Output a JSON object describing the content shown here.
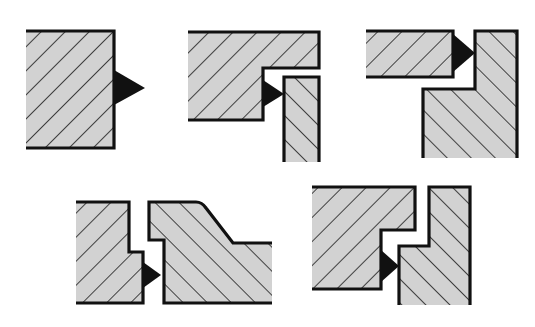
{
  "diagram": {
    "title": "",
    "colors": {
      "part_fill": "#d2d2d2",
      "hatch": "#1a1a1a",
      "outline": "#111111",
      "weld": "#111111",
      "background": "#ffffff"
    },
    "joints": [
      {
        "id": "joint-1",
        "label": "",
        "type": "single plate with external fillet weld"
      },
      {
        "id": "joint-2",
        "label": "",
        "type": "stepped plate with vertical plate, fillet weld in step"
      },
      {
        "id": "joint-3",
        "label": "",
        "type": "flat bar to stepped vertical member, fillet weld"
      },
      {
        "id": "joint-4",
        "label": "",
        "type": "stepped plate to tapered plate, fillet weld"
      },
      {
        "id": "joint-5",
        "label": "",
        "type": "interlocking stepped members, fillet weld"
      }
    ]
  }
}
